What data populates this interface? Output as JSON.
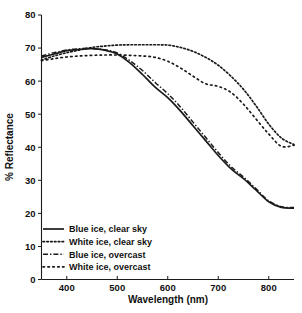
{
  "chart_data": {
    "type": "line",
    "title": "",
    "xlabel": "Wavelength (nm)",
    "ylabel": "% Reflectance",
    "xlim": [
      350,
      850
    ],
    "ylim": [
      0,
      80
    ],
    "xticks": [
      400,
      500,
      600,
      700,
      800
    ],
    "yticks": [
      0,
      10,
      20,
      30,
      40,
      50,
      60,
      70,
      80
    ],
    "xticklabels": [
      "400",
      "500",
      "600",
      "700",
      "800"
    ],
    "yticklabels": [
      "0",
      "10",
      "20",
      "30",
      "40",
      "50",
      "60",
      "70",
      "80"
    ],
    "grid": false,
    "legend_position": "lower-left",
    "x": [
      350,
      375,
      400,
      425,
      450,
      475,
      500,
      525,
      550,
      575,
      600,
      625,
      650,
      675,
      700,
      725,
      750,
      775,
      800,
      825,
      850
    ],
    "series": [
      {
        "name": "Blue ice, clear sky",
        "style": "solid",
        "color": "#1a1a1a",
        "values": [
          67.2,
          68.2,
          69.2,
          69.6,
          69.8,
          69.4,
          68.2,
          65.5,
          62.0,
          58.2,
          55.0,
          51.0,
          46.5,
          42.0,
          37.5,
          33.5,
          30.5,
          27.0,
          23.5,
          21.8,
          21.6
        ]
      },
      {
        "name": "White ice, clear sky",
        "style": "dotted",
        "color": "#1a1a1a",
        "values": [
          66.4,
          67.6,
          68.6,
          69.4,
          70.2,
          70.6,
          70.9,
          71.0,
          71.0,
          71.0,
          70.9,
          70.2,
          69.0,
          67.2,
          64.8,
          61.5,
          57.5,
          52.5,
          47.0,
          42.8,
          40.8
        ]
      },
      {
        "name": "Blue ice, overcast",
        "style": "dashdot",
        "color": "#1a1a1a",
        "values": [
          67.6,
          68.6,
          69.4,
          69.8,
          69.9,
          69.5,
          68.5,
          66.2,
          63.2,
          59.6,
          56.2,
          52.2,
          47.6,
          43.0,
          38.4,
          34.2,
          31.0,
          27.4,
          23.8,
          22.0,
          21.8
        ]
      },
      {
        "name": "White ice, overcast",
        "style": "sparse-dotted",
        "color": "#1a1a1a",
        "values": [
          66.2,
          66.8,
          67.3,
          67.6,
          67.8,
          67.9,
          67.9,
          67.8,
          67.6,
          67.2,
          66.0,
          64.0,
          61.5,
          59.2,
          58.4,
          56.6,
          53.0,
          48.5,
          44.0,
          40.3,
          40.6
        ]
      }
    ],
    "legend": [
      {
        "label": "Blue ice, clear sky",
        "style": "solid"
      },
      {
        "label": "White ice, clear sky",
        "style": "dotted"
      },
      {
        "label": "Blue ice, overcast",
        "style": "dashdot"
      },
      {
        "label": "White ice, overcast",
        "style": "sparse-dotted"
      }
    ]
  }
}
